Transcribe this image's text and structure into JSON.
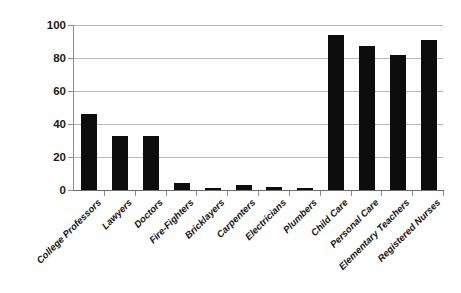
{
  "chart_data": {
    "type": "bar",
    "title": "",
    "subtitle": "",
    "xlabel": "",
    "ylabel": "",
    "ylim": [
      0,
      100
    ],
    "yticks": [
      0,
      20,
      40,
      60,
      80,
      100
    ],
    "grid": true,
    "legend": "none",
    "bar_color": "#0d0d0d",
    "gridline_color": "#b9b9b9",
    "axis_color": "#6e6e6e",
    "background": "#ffffff",
    "categories": [
      "College Professors",
      "Lawyers",
      "Doctors",
      "Fire-Fighters",
      "Bricklayers",
      "Carpenters",
      "Electricians",
      "Plumbers",
      "Child Care",
      "Personal Care",
      "Elementary Teachers",
      "Registered Nurses"
    ],
    "values": [
      46,
      33,
      33,
      4,
      1.5,
      3,
      2,
      1.5,
      94,
      87,
      82,
      91
    ]
  },
  "axes": {
    "y_tick_labels": [
      "100",
      "80",
      "60",
      "40",
      "20",
      "0"
    ]
  }
}
